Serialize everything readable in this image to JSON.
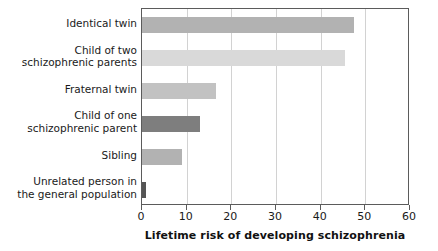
{
  "chart_data": {
    "type": "bar",
    "orientation": "horizontal",
    "title": "",
    "xlabel": "Lifetime risk of developing schizophrenia",
    "ylabel": "",
    "xlim": [
      0,
      60
    ],
    "xticks": [
      0,
      10,
      20,
      30,
      40,
      50,
      60
    ],
    "xtick_labels": [
      "0",
      "10",
      "20",
      "30",
      "40",
      "50",
      "60"
    ],
    "grid": "vertical",
    "legend": "none",
    "categories": [
      "Identical twin",
      "Child of two\nschizophrenic parents",
      "Fraternal twin",
      "Child of one\nschizophrenic parent",
      "Sibling",
      "Unrelated person in\nthe general population"
    ],
    "values": [
      47.5,
      45.5,
      16.5,
      13,
      9,
      1
    ],
    "bar_colors": [
      "#b2b2b2",
      "#d9d9d9",
      "#c2c2c2",
      "#7e7e7e",
      "#b2b2b2",
      "#555555"
    ]
  },
  "axis": {
    "frame_color": "#5b5b5b",
    "grid_color": "#d2d2d2",
    "text_color": "#1a1a1a"
  }
}
